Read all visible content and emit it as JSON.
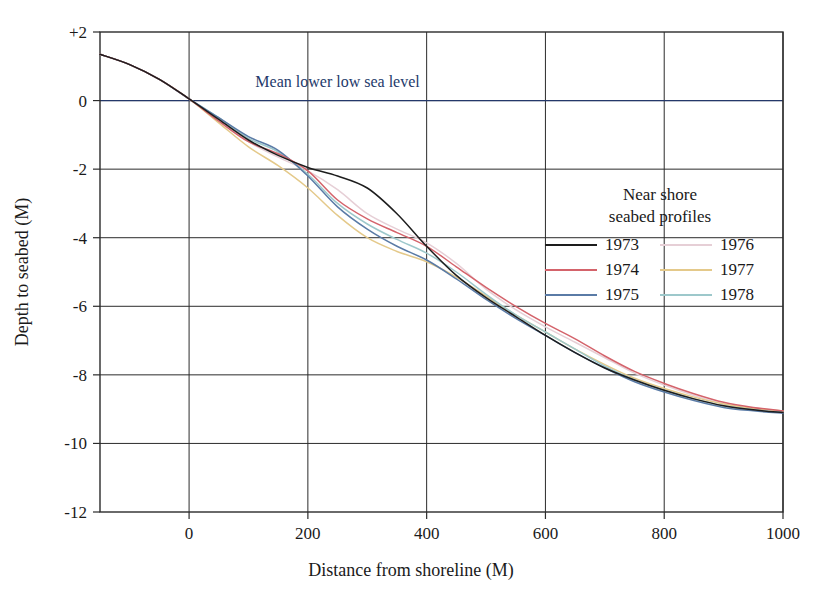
{
  "chart_data": {
    "type": "line",
    "title": "",
    "xlabel": "Distance from shoreline (M)",
    "ylabel": "Depth to seabed (M)",
    "xlim": [
      -150,
      1000
    ],
    "ylim": [
      -12,
      2
    ],
    "xticks": [
      0,
      200,
      400,
      600,
      800,
      1000
    ],
    "xtick_labels": [
      "0",
      "200",
      "400",
      "600",
      "800",
      "1000"
    ],
    "yticks": [
      2,
      0,
      -2,
      -4,
      -6,
      -8,
      -10,
      -12
    ],
    "ytick_labels": [
      "+2",
      "0",
      "-2",
      "-4",
      "-6",
      "-8",
      "-10",
      "-12"
    ],
    "grid": true,
    "legend_position": "inside-right",
    "legend_title": [
      "Near shore",
      "seabed profiles"
    ],
    "annotations": [
      {
        "text": "Mean lower low sea level",
        "x": 250,
        "y": 0.15,
        "color": "#24386a",
        "name": "mean-lower-low-sea-level"
      }
    ],
    "x": [
      -150,
      -100,
      -50,
      0,
      50,
      100,
      150,
      200,
      250,
      300,
      350,
      400,
      450,
      500,
      550,
      600,
      650,
      700,
      750,
      800,
      850,
      900,
      950,
      1000
    ],
    "series": [
      {
        "name": "1973",
        "color": "#1d1d1d",
        "values": [
          1.35,
          1.05,
          0.62,
          0.05,
          -0.55,
          -1.15,
          -1.6,
          -1.95,
          -2.2,
          -2.55,
          -3.3,
          -4.25,
          -5.1,
          -5.75,
          -6.3,
          -6.85,
          -7.35,
          -7.8,
          -8.15,
          -8.45,
          -8.7,
          -8.9,
          -9.02,
          -9.1
        ]
      },
      {
        "name": "1974",
        "color": "#d4636b",
        "values": [
          1.35,
          1.05,
          0.62,
          0.05,
          -0.6,
          -1.2,
          -1.55,
          -2.05,
          -2.9,
          -3.45,
          -3.85,
          -4.25,
          -4.85,
          -5.45,
          -6.0,
          -6.5,
          -6.95,
          -7.45,
          -7.9,
          -8.25,
          -8.55,
          -8.8,
          -8.95,
          -9.05
        ]
      },
      {
        "name": "1975",
        "color": "#5a7ba6",
        "values": [
          1.35,
          1.05,
          0.62,
          0.05,
          -0.5,
          -1.05,
          -1.45,
          -2.2,
          -3.1,
          -3.75,
          -4.25,
          -4.65,
          -5.2,
          -5.8,
          -6.35,
          -6.85,
          -7.35,
          -7.8,
          -8.2,
          -8.5,
          -8.75,
          -8.95,
          -9.05,
          -9.12
        ]
      },
      {
        "name": "1976",
        "color": "#e6cfd6",
        "values": [
          1.35,
          1.05,
          0.62,
          0.05,
          -0.55,
          -1.2,
          -1.65,
          -2.05,
          -2.6,
          -3.3,
          -3.75,
          -4.15,
          -4.75,
          -5.5,
          -6.1,
          -6.6,
          -7.05,
          -7.5,
          -7.95,
          -8.3,
          -8.6,
          -8.85,
          -9.0,
          -9.08
        ]
      },
      {
        "name": "1977",
        "color": "#e4c98a",
        "values": [
          1.35,
          1.05,
          0.62,
          0.05,
          -0.65,
          -1.35,
          -1.9,
          -2.55,
          -3.35,
          -4.0,
          -4.4,
          -4.7,
          -5.15,
          -5.7,
          -6.25,
          -6.75,
          -7.25,
          -7.7,
          -8.1,
          -8.4,
          -8.65,
          -8.85,
          -8.98,
          -9.05
        ]
      },
      {
        "name": "1978",
        "color": "#9dc8cb",
        "values": [
          1.35,
          1.05,
          0.62,
          0.05,
          -0.5,
          -1.1,
          -1.5,
          -2.15,
          -3.0,
          -3.6,
          -4.05,
          -4.45,
          -5.0,
          -5.65,
          -6.25,
          -6.75,
          -7.25,
          -7.75,
          -8.15,
          -8.45,
          -8.7,
          -8.9,
          -9.02,
          -9.1
        ]
      }
    ],
    "legend_entries_left": [
      "1973",
      "1974",
      "1975"
    ],
    "legend_entries_right": [
      "1976",
      "1977",
      "1978"
    ]
  },
  "colors": {
    "axis": "#2b2b2b",
    "grid": "#2b2b2b",
    "sea_level": "#24386a",
    "background": "#ffffff"
  }
}
